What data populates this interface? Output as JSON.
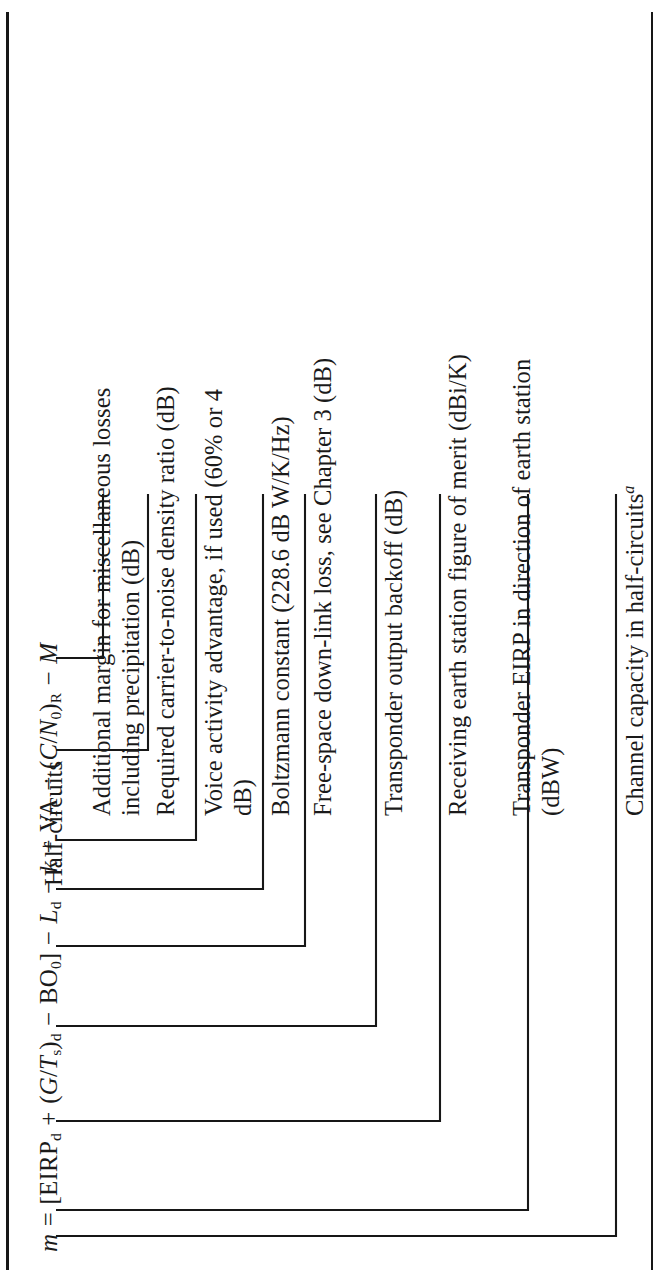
{
  "figure": {
    "orientation_deg": -90,
    "page_rule_color": "#171717",
    "text_color": "#1a1a1a",
    "background": "#ffffff"
  },
  "equation": {
    "lhs": "m",
    "relation": "=",
    "full_text": "m = [EIRPd + (G/Ts)d − BO0] − Ld − k + VA − (C/N0)R − M",
    "terms": [
      {
        "id": "eirp",
        "text": "EIRP",
        "subscript": "d"
      },
      {
        "id": "gts",
        "text": "(G/Ts)",
        "subscript": "d"
      },
      {
        "id": "bo",
        "text": "BO",
        "subscript": "0"
      },
      {
        "id": "ld",
        "text": "L",
        "subscript": "d"
      },
      {
        "id": "k",
        "text": "k",
        "subscript": ""
      },
      {
        "id": "va",
        "text": "VA",
        "subscript": ""
      },
      {
        "id": "cn0",
        "text": "(C/N0)",
        "subscript": "R"
      },
      {
        "id": "m",
        "text": "M",
        "subscript": ""
      }
    ]
  },
  "header": {
    "label": "Half-circuits"
  },
  "labels": [
    {
      "id": "label-margin",
      "text": "Additional margin for miscellaneous losses\nincluding precipitation (dB)"
    },
    {
      "id": "label-cn0",
      "text": "Required carrier-to-noise density ratio (dB)"
    },
    {
      "id": "label-va",
      "text": "Voice activity advantage, if used (60% or 4\ndB)"
    },
    {
      "id": "label-boltzmann",
      "text": "Boltzmann constant (228.6 dB W/K/Hz)"
    },
    {
      "id": "label-fsl",
      "text": "Free-space down-link loss, see Chapter 3 (dB)"
    },
    {
      "id": "label-backoff",
      "text": "Transponder output backoff (dB)"
    },
    {
      "id": "label-gt",
      "text": "Receiving earth station figure of merit (dBi/K)"
    },
    {
      "id": "label-eirp",
      "text": "Transponder EIRP in direction of earth station\n(dBW)"
    },
    {
      "id": "label-m",
      "text": "Channel capacity in half-circuits"
    }
  ],
  "footnote_marker": "a"
}
